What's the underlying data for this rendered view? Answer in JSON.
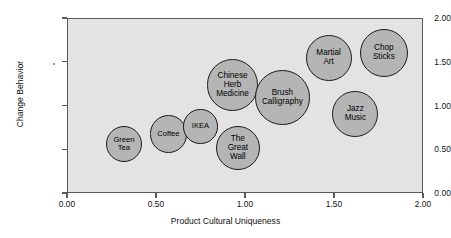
{
  "chart_data": {
    "type": "scatter",
    "title": "",
    "xlabel": "Product Cultural Uniqueness",
    "ylabel": "Change Behavior",
    "xlim": [
      0.0,
      2.0
    ],
    "ylim": [
      0.0,
      2.0
    ],
    "xticks": [
      "0.00",
      "0.50",
      "1.00",
      "1.50",
      "2.00"
    ],
    "yticks": [
      "0.00",
      "0.50",
      "1.00",
      "1.50",
      "2.00"
    ],
    "xtick_values": [
      0.0,
      0.5,
      1.0,
      1.5,
      2.0
    ],
    "ytick_values": [
      0.0,
      0.5,
      1.0,
      1.5,
      2.0
    ],
    "grid": false,
    "legend": "none",
    "plot_background": "#e3e3e3",
    "bubble_fill": "#b5b5b5",
    "bubble_stroke": "#1c1c1c",
    "points": [
      {
        "label": "Green Tea",
        "label_lines": [
          "Green",
          "Tea"
        ],
        "x": 0.32,
        "y": 0.56,
        "size": 0.41
      },
      {
        "label": "Coffee",
        "label_lines": [
          "Coffee"
        ],
        "x": 0.57,
        "y": 0.67,
        "size": 0.43
      },
      {
        "label": "IKEA",
        "label_lines": [
          "IKEA"
        ],
        "x": 0.75,
        "y": 0.76,
        "size": 0.39
      },
      {
        "label": "Chinese Herb Medicine",
        "label_lines": [
          "Chinese",
          "Herb",
          "Medicine"
        ],
        "x": 0.93,
        "y": 1.23,
        "size": 0.59
      },
      {
        "label": "The Great Wall",
        "label_lines": [
          "The",
          "Great",
          "Wall"
        ],
        "x": 0.96,
        "y": 0.51,
        "size": 0.5
      },
      {
        "label": "Brush Calligraphy",
        "label_lines": [
          "Brush",
          "Calligraphy"
        ],
        "x": 1.21,
        "y": 1.09,
        "size": 0.62
      },
      {
        "label": "Martial Art",
        "label_lines": [
          "Martial",
          "Art"
        ],
        "x": 1.47,
        "y": 1.54,
        "size": 0.52
      },
      {
        "label": "Jazz Music",
        "label_lines": [
          "Jazz",
          "Music"
        ],
        "x": 1.62,
        "y": 0.9,
        "size": 0.52
      },
      {
        "label": "Chop Sticks",
        "label_lines": [
          "Chop",
          "Sticks"
        ],
        "x": 1.78,
        "y": 1.6,
        "size": 0.55
      }
    ]
  }
}
